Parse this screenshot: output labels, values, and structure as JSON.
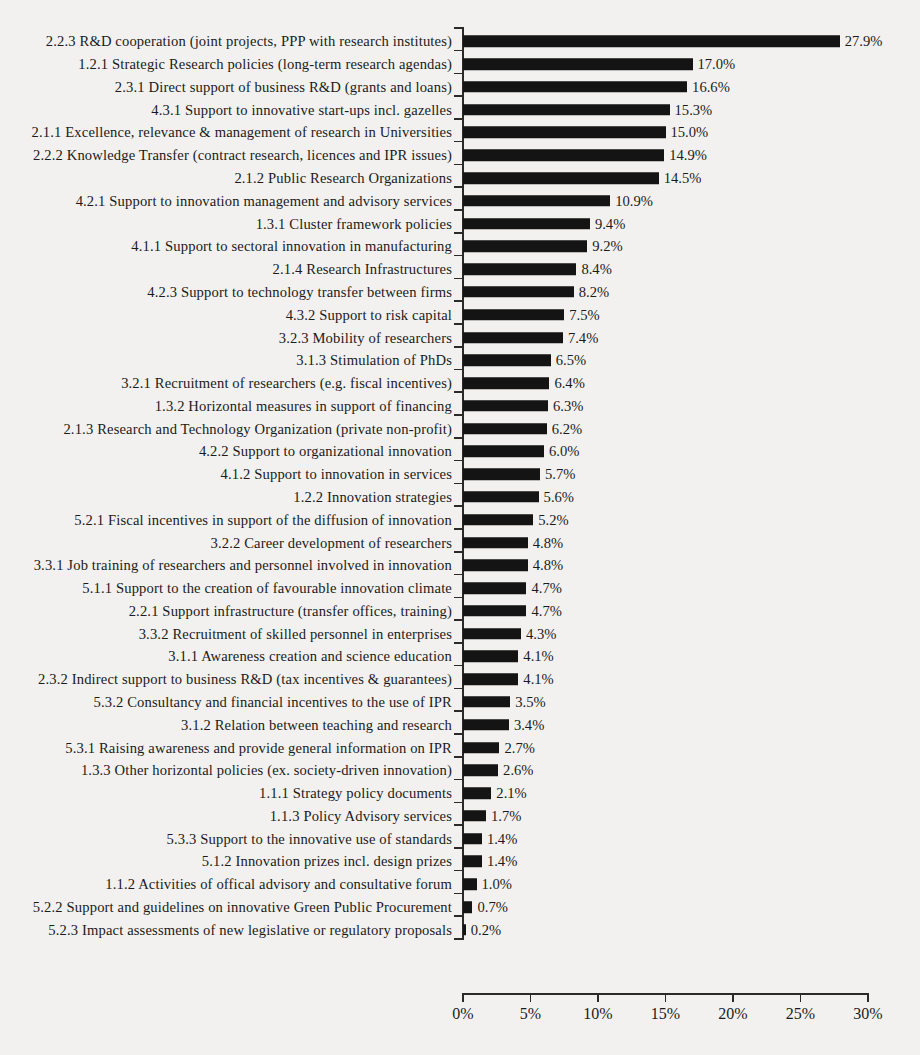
{
  "chart_data": {
    "type": "bar",
    "orientation": "horizontal",
    "title": "",
    "subtitle": "",
    "xlabel": "",
    "ylabel": "",
    "xlim": [
      0,
      30
    ],
    "xticks": [
      "0%",
      "5%",
      "10%",
      "15%",
      "20%",
      "25%",
      "30%"
    ],
    "xtick_values": [
      0,
      5,
      10,
      15,
      20,
      25,
      30
    ],
    "grid": false,
    "legend": null,
    "bar_color": "#141414",
    "value_label_suffix": "%",
    "categories": [
      "2.2.3 R&D cooperation (joint projects, PPP with research institutes)",
      "1.2.1 Strategic Research policies (long-term research agendas)",
      "2.3.1 Direct support of business R&D (grants and loans)",
      "4.3.1 Support to innovative start-ups incl. gazelles",
      "2.1.1 Excellence, relevance & management of research in Universities",
      "2.2.2 Knowledge Transfer (contract research, licences and IPR issues)",
      "2.1.2 Public Research Organizations",
      "4.2.1 Support to innovation management and advisory services",
      "1.3.1 Cluster framework policies",
      "4.1.1 Support to sectoral innovation in manufacturing",
      "2.1.4 Research Infrastructures",
      "4.2.3 Support to technology transfer between firms",
      "4.3.2 Support to risk capital",
      "3.2.3 Mobility of researchers",
      "3.1.3 Stimulation of PhDs",
      "3.2.1 Recruitment of researchers (e.g. fiscal incentives)",
      "1.3.2 Horizontal measures in support of financing",
      "2.1.3 Research and Technology Organization (private non-profit)",
      "4.2.2 Support to organizational innovation",
      "4.1.2 Support to innovation in services",
      "1.2.2 Innovation strategies",
      "5.2.1 Fiscal incentives in support of the diffusion of innovation",
      "3.2.2 Career development of researchers",
      "3.3.1 Job training of researchers and personnel involved in innovation",
      "5.1.1 Support to the creation of favourable innovation climate",
      "2.2.1 Support infrastructure (transfer offices, training)",
      "3.3.2 Recruitment of skilled personnel in enterprises",
      "3.1.1 Awareness creation and science education",
      "2.3.2 Indirect support to business R&D (tax incentives & guarantees)",
      "5.3.2 Consultancy and financial incentives to the use of IPR",
      "3.1.2 Relation between teaching and research",
      "5.3.1 Raising awareness and provide general information on IPR",
      "1.3.3 Other horizontal policies (ex. society-driven innovation)",
      "1.1.1 Strategy policy documents",
      "1.1.3 Policy Advisory services",
      "5.3.3 Support to the innovative use of standards",
      "5.1.2 Innovation prizes incl. design prizes",
      "1.1.2 Activities of offical advisory and consultative forum",
      "5.2.2 Support and guidelines on innovative Green Public Procurement",
      "5.2.3 Impact assessments of new legislative or regulatory proposals"
    ],
    "values": [
      27.9,
      17.0,
      16.6,
      15.3,
      15.0,
      14.9,
      14.5,
      10.9,
      9.4,
      9.2,
      8.4,
      8.2,
      7.5,
      7.4,
      6.5,
      6.4,
      6.3,
      6.2,
      6.0,
      5.7,
      5.6,
      5.2,
      4.8,
      4.8,
      4.7,
      4.7,
      4.3,
      4.1,
      4.1,
      3.5,
      3.4,
      2.7,
      2.6,
      2.1,
      1.7,
      1.4,
      1.4,
      1.0,
      0.7,
      0.2
    ],
    "value_labels": [
      "27.9%",
      "17.0%",
      "16.6%",
      "15.3%",
      "15.0%",
      "14.9%",
      "14.5%",
      "10.9%",
      "9.4%",
      "9.2%",
      "8.4%",
      "8.2%",
      "7.5%",
      "7.4%",
      "6.5%",
      "6.4%",
      "6.3%",
      "6.2%",
      "6.0%",
      "5.7%",
      "5.6%",
      "5.2%",
      "4.8%",
      "4.8%",
      "4.7%",
      "4.7%",
      "4.3%",
      "4.1%",
      "4.1%",
      "3.5%",
      "3.4%",
      "2.7%",
      "2.6%",
      "2.1%",
      "1.7%",
      "1.4%",
      "1.4%",
      "1.0%",
      "0.7%",
      "0.2%"
    ]
  }
}
